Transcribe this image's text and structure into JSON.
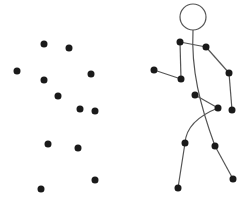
{
  "colors": {
    "dot": "#1a1a1a",
    "line": "#555555",
    "head_stroke": "#555555",
    "background": "#ffffff"
  },
  "dot_radius": 3.5,
  "scattered_dots": [
    {
      "x": 44,
      "y": 44
    },
    {
      "x": 69,
      "y": 48
    },
    {
      "x": 17,
      "y": 71
    },
    {
      "x": 44,
      "y": 80
    },
    {
      "x": 91,
      "y": 74
    },
    {
      "x": 58,
      "y": 96
    },
    {
      "x": 80,
      "y": 109
    },
    {
      "x": 95,
      "y": 111
    },
    {
      "x": 48,
      "y": 144
    },
    {
      "x": 78,
      "y": 148
    },
    {
      "x": 95,
      "y": 180
    },
    {
      "x": 41,
      "y": 189
    }
  ],
  "stick_figure": {
    "head": {
      "cx": 193,
      "cy": 17,
      "r": 13
    },
    "joints": [
      {
        "name": "left-shoulder",
        "x": 180,
        "y": 42
      },
      {
        "name": "right-shoulder",
        "x": 206,
        "y": 47
      },
      {
        "name": "left-elbow",
        "x": 181,
        "y": 79
      },
      {
        "name": "left-hand",
        "x": 154,
        "y": 70
      },
      {
        "name": "right-elbow",
        "x": 229,
        "y": 73
      },
      {
        "name": "right-hand",
        "x": 232,
        "y": 110
      },
      {
        "name": "left-hip",
        "x": 195,
        "y": 95
      },
      {
        "name": "right-hip",
        "x": 218,
        "y": 108
      },
      {
        "name": "left-knee",
        "x": 185,
        "y": 143
      },
      {
        "name": "left-foot",
        "x": 178,
        "y": 188
      },
      {
        "name": "right-knee",
        "x": 215,
        "y": 146
      },
      {
        "name": "right-foot",
        "x": 233,
        "y": 179
      }
    ],
    "segments": [
      {
        "from": "left-shoulder",
        "to": "right-shoulder"
      },
      {
        "from": "left-shoulder",
        "to": "left-elbow"
      },
      {
        "from": "left-elbow",
        "to": "left-hand"
      },
      {
        "from": "right-shoulder",
        "to": "right-elbow"
      },
      {
        "from": "right-elbow",
        "to": "right-hand"
      },
      {
        "from": "left-hip",
        "to": "right-hip"
      },
      {
        "from": "left-knee",
        "to": "left-foot"
      },
      {
        "from": "right-knee",
        "to": "right-foot"
      }
    ],
    "curves": [
      {
        "name": "spine",
        "d": "M193,30 C191,70 200,105 215,146"
      },
      {
        "name": "thigh",
        "d": "M218,108 C198,116 186,128 185,143"
      }
    ]
  }
}
